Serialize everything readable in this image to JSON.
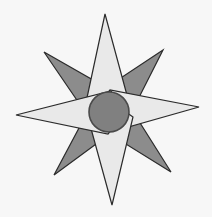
{
  "figure": {
    "name": "compass-rose-star",
    "canvas": {
      "width": 212,
      "height": 217,
      "background_color": "#f7f7f7"
    },
    "palette": {
      "background": "#f7f7f7",
      "light_point_fill": "#e9e9e9",
      "dark_point_fill": "#8c8c8c",
      "center_circle_fill": "#808080",
      "outline": "#2b2b2b",
      "center_outline": "#4a4a4a"
    },
    "center": {
      "x": 109,
      "y": 112
    },
    "center_circle": {
      "cx": 109,
      "cy": 112,
      "r": 20,
      "stroke_width": 1.6
    },
    "outline_width": 1.2,
    "dark_points": [
      {
        "name": "point-northwest",
        "tip_x": 44,
        "tip_y": 52,
        "points": "44,52 121,96 96,128"
      },
      {
        "name": "point-northeast",
        "tip_x": 163,
        "tip_y": 50,
        "points": "163,50 95,95 124,127"
      },
      {
        "name": "point-southwest",
        "tip_x": 54,
        "tip_y": 175,
        "points": "54,175 95,98 126,122"
      },
      {
        "name": "point-southeast",
        "tip_x": 171,
        "tip_y": 172,
        "points": "171,172 123,96 92,123"
      }
    ],
    "light_points": [
      {
        "name": "point-north",
        "tip_x": 105,
        "tip_y": 14,
        "points": "105,14 131,110 109,124 85,107"
      },
      {
        "name": "point-east",
        "tip_x": 199,
        "tip_y": 107,
        "points": "199,107 107,133 93,111 110,90"
      },
      {
        "name": "point-south",
        "tip_x": 112,
        "tip_y": 205,
        "points": "112,205 87,114 109,100 133,117"
      },
      {
        "name": "point-west",
        "tip_x": 16,
        "tip_y": 115,
        "points": "16,115 111,91 125,113 108,134"
      }
    ]
  }
}
